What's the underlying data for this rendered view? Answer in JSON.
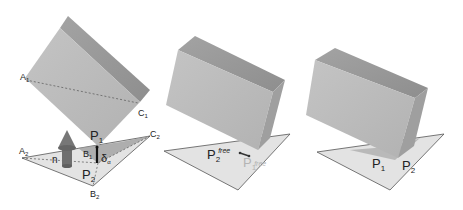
{
  "colors": {
    "background": "#ffffff",
    "box_front": "#bdbdbd",
    "box_top": "#a6a6a6",
    "box_side": "#999999",
    "plane": "#e3e3e3",
    "plane_edge": "#555555",
    "plane_shadow": "#9a9a9a",
    "arrow": "#6e6e6e",
    "dashed": "#555555",
    "text": "#222222",
    "faded_text": "#b4b4b4"
  },
  "panels": [
    {
      "id": "left",
      "labels": {
        "A1": {
          "main": "A",
          "sub": "1"
        },
        "C1": {
          "main": "C",
          "sub": "1"
        },
        "A2": {
          "main": "A",
          "sub": "2"
        },
        "C2": {
          "main": "C",
          "sub": "2"
        },
        "B1": {
          "main": "B",
          "sub": "1"
        },
        "B2": {
          "main": "B",
          "sub": "2"
        },
        "P1": {
          "main": "P",
          "sub": "1"
        },
        "P2": {
          "main": "P",
          "sub": "2"
        },
        "n": "n",
        "delta": {
          "main": "δ",
          "sub": "α"
        }
      }
    },
    {
      "id": "middle",
      "labels": {
        "P2free": {
          "main": "P",
          "sub": "2",
          "sup": "free"
        },
        "P1free": {
          "main": "P",
          "sub": "1",
          "sup": "free"
        }
      }
    },
    {
      "id": "right",
      "labels": {
        "P1": {
          "main": "P",
          "sub": "1"
        },
        "P2": {
          "main": "P",
          "sub": "2"
        }
      }
    }
  ]
}
